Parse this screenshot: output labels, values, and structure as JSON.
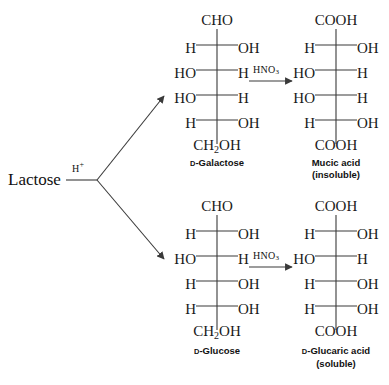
{
  "diagram": {
    "reactant": "Lactose",
    "catalyst": "H",
    "catalyst_charge": "+",
    "reagent": "HNO",
    "reagent_sub": "3"
  },
  "structures": {
    "galactose": {
      "name": "Galactose",
      "prefix": "D",
      "caption": "-Galactose",
      "top": "CHO",
      "bottom": "CH",
      "bottom_sub": "2",
      "bottom_tail": "OH",
      "rows": [
        {
          "left": "H",
          "right": "OH"
        },
        {
          "left": "HO",
          "right": "H"
        },
        {
          "left": "HO",
          "right": "H"
        },
        {
          "left": "H",
          "right": "OH"
        }
      ]
    },
    "mucic_acid": {
      "name": "Mucic acid",
      "caption": "Mucic acid",
      "note": "(insoluble)",
      "top": "COOH",
      "bottom": "COOH",
      "rows": [
        {
          "left": "H",
          "right": "OH"
        },
        {
          "left": "HO",
          "right": "H"
        },
        {
          "left": "HO",
          "right": "H"
        },
        {
          "left": "H",
          "right": "OH"
        }
      ]
    },
    "glucose": {
      "name": "Glucose",
      "prefix": "D",
      "caption": "-Glucose",
      "top": "CHO",
      "bottom": "CH",
      "bottom_sub": "2",
      "bottom_tail": "OH",
      "rows": [
        {
          "left": "H",
          "right": "OH"
        },
        {
          "left": "HO",
          "right": "H"
        },
        {
          "left": "H",
          "right": "OH"
        },
        {
          "left": "H",
          "right": "OH"
        }
      ]
    },
    "glucaric_acid": {
      "name": "Glucaric acid",
      "prefix": "D",
      "caption": "-Glucaric acid",
      "note": "(soluble)",
      "top": "COOH",
      "bottom": "COOH",
      "rows": [
        {
          "left": "H",
          "right": "OH"
        },
        {
          "left": "HO",
          "right": "H"
        },
        {
          "left": "H",
          "right": "OH"
        },
        {
          "left": "H",
          "right": "OH"
        }
      ]
    }
  },
  "colors": {
    "line": "#3a3a3a",
    "text": "#111111",
    "background": "#ffffff"
  }
}
